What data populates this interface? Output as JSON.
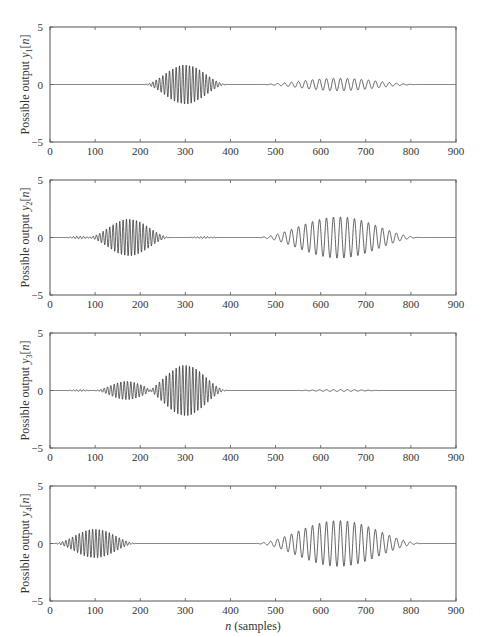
{
  "figure": {
    "xlabel_prefix": "n",
    "xlabel_suffix": " (samples)"
  },
  "colors": {
    "axis": "#555555",
    "line": "#222222",
    "text": "#333333"
  },
  "chart_data": [
    {
      "type": "line",
      "title": "",
      "ylabel": "Possible output y1[n]",
      "ylabel_parts": {
        "prefix": "Possible output ",
        "var": "y",
        "sub": "1",
        "arg": "[n]"
      },
      "xlabel": "",
      "xlim": [
        0,
        900
      ],
      "ylim": [
        -5,
        5
      ],
      "x_ticks": [
        0,
        100,
        200,
        300,
        400,
        500,
        600,
        700,
        800,
        900
      ],
      "y_ticks": [
        5,
        0,
        -5
      ],
      "grid": false,
      "bursts": [
        {
          "center": 300,
          "half_width": 95,
          "amplitude": 1.7,
          "period": 7.4
        },
        {
          "center": 640,
          "half_width": 180,
          "amplitude": 0.55,
          "period": 15.5
        }
      ]
    },
    {
      "type": "line",
      "title": "",
      "ylabel": "Possible output y2[n]",
      "ylabel_parts": {
        "prefix": "Possible output ",
        "var": "y",
        "sub": "2",
        "arg": "[n]"
      },
      "xlabel": "",
      "xlim": [
        0,
        900
      ],
      "ylim": [
        -5,
        5
      ],
      "x_ticks": [
        0,
        100,
        200,
        300,
        400,
        500,
        600,
        700,
        800,
        900
      ],
      "y_ticks": [
        5,
        0,
        -5
      ],
      "grid": false,
      "bursts": [
        {
          "center": 65,
          "half_width": 35,
          "amplitude": 0.12,
          "period": 7.4
        },
        {
          "center": 175,
          "half_width": 95,
          "amplitude": 1.6,
          "period": 7.4
        },
        {
          "center": 340,
          "half_width": 40,
          "amplitude": 0.08,
          "period": 7.4
        },
        {
          "center": 640,
          "half_width": 185,
          "amplitude": 1.8,
          "period": 15.5
        }
      ]
    },
    {
      "type": "line",
      "title": "",
      "ylabel": "Possible output y3[n]",
      "ylabel_parts": {
        "prefix": "Possible output ",
        "var": "y",
        "sub": "3",
        "arg": "[n]"
      },
      "xlabel": "",
      "xlim": [
        0,
        900
      ],
      "ylim": [
        -5,
        5
      ],
      "x_ticks": [
        0,
        100,
        200,
        300,
        400,
        500,
        600,
        700,
        800,
        900
      ],
      "y_ticks": [
        5,
        0,
        -5
      ],
      "grid": false,
      "bursts": [
        {
          "center": 65,
          "half_width": 30,
          "amplitude": 0.08,
          "period": 7.4
        },
        {
          "center": 170,
          "half_width": 75,
          "amplitude": 0.8,
          "period": 7.4
        },
        {
          "center": 300,
          "half_width": 95,
          "amplitude": 2.2,
          "period": 7.4
        },
        {
          "center": 640,
          "half_width": 110,
          "amplitude": 0.08,
          "period": 15.5
        }
      ]
    },
    {
      "type": "line",
      "title": "",
      "ylabel": "Possible output y4[n]",
      "ylabel_parts": {
        "prefix": "Possible output ",
        "var": "y",
        "sub": "4",
        "arg": "[n]"
      },
      "xlabel": "n (samples)",
      "xlim": [
        0,
        900
      ],
      "ylim": [
        -5,
        5
      ],
      "x_ticks": [
        0,
        100,
        200,
        300,
        400,
        500,
        600,
        700,
        800,
        900
      ],
      "y_ticks": [
        5,
        0,
        -5
      ],
      "grid": false,
      "bursts": [
        {
          "center": 100,
          "half_width": 95,
          "amplitude": 1.25,
          "period": 7.4
        },
        {
          "center": 640,
          "half_width": 190,
          "amplitude": 2.0,
          "period": 15.5
        }
      ]
    }
  ]
}
